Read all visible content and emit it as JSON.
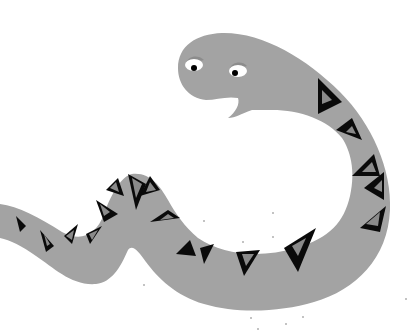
{
  "image": {
    "subject": "cartoon snake",
    "width": 408,
    "height": 330,
    "background": "#ffffff"
  },
  "colors": {
    "body": "#a3a3a3",
    "stripe": "#0a0a0a",
    "stripe_inner": "#8a8a8a",
    "eye_white": "#ffffff",
    "pupil": "#000000",
    "brow": "#8c8c8c",
    "speck": "#777777"
  }
}
